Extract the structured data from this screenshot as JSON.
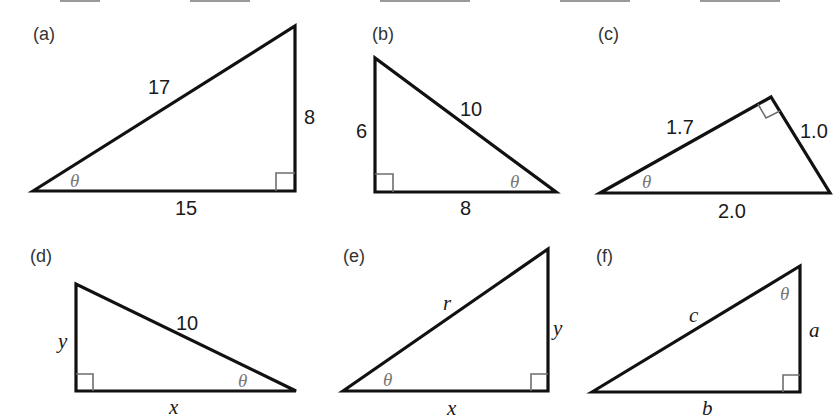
{
  "figure": {
    "top_cutoff_text": "",
    "panels": [
      {
        "id": "a",
        "label": "(a)",
        "sides": {
          "hypotenuse": "17",
          "opposite": "8",
          "adjacent": "15"
        },
        "angle": "θ",
        "right_angle_at": "bottom-right"
      },
      {
        "id": "b",
        "label": "(b)",
        "sides": {
          "hypotenuse": "10",
          "opposite": "6",
          "adjacent": "8"
        },
        "angle": "θ",
        "right_angle_at": "bottom-left"
      },
      {
        "id": "c",
        "label": "(c)",
        "sides": {
          "hypotenuse": "2.0",
          "adjacent": "1.7",
          "opposite": "1.0"
        },
        "angle": "θ",
        "right_angle_at": "top"
      },
      {
        "id": "d",
        "label": "(d)",
        "sides": {
          "hypotenuse": "10",
          "opposite": "y",
          "adjacent": "x"
        },
        "angle": "θ",
        "right_angle_at": "bottom-left"
      },
      {
        "id": "e",
        "label": "(e)",
        "sides": {
          "hypotenuse": "r",
          "opposite": "y",
          "adjacent": "x"
        },
        "angle": "θ",
        "right_angle_at": "bottom-right"
      },
      {
        "id": "f",
        "label": "(f)",
        "sides": {
          "hypotenuse": "c",
          "adjacent": "a",
          "opposite": "b"
        },
        "angle": "θ",
        "right_angle_at": "bottom-right"
      }
    ]
  },
  "colors": {
    "stroke": "#111111",
    "right_angle_mark": "#6e6e6e",
    "theta": "#777777",
    "background": "#ffffff"
  }
}
